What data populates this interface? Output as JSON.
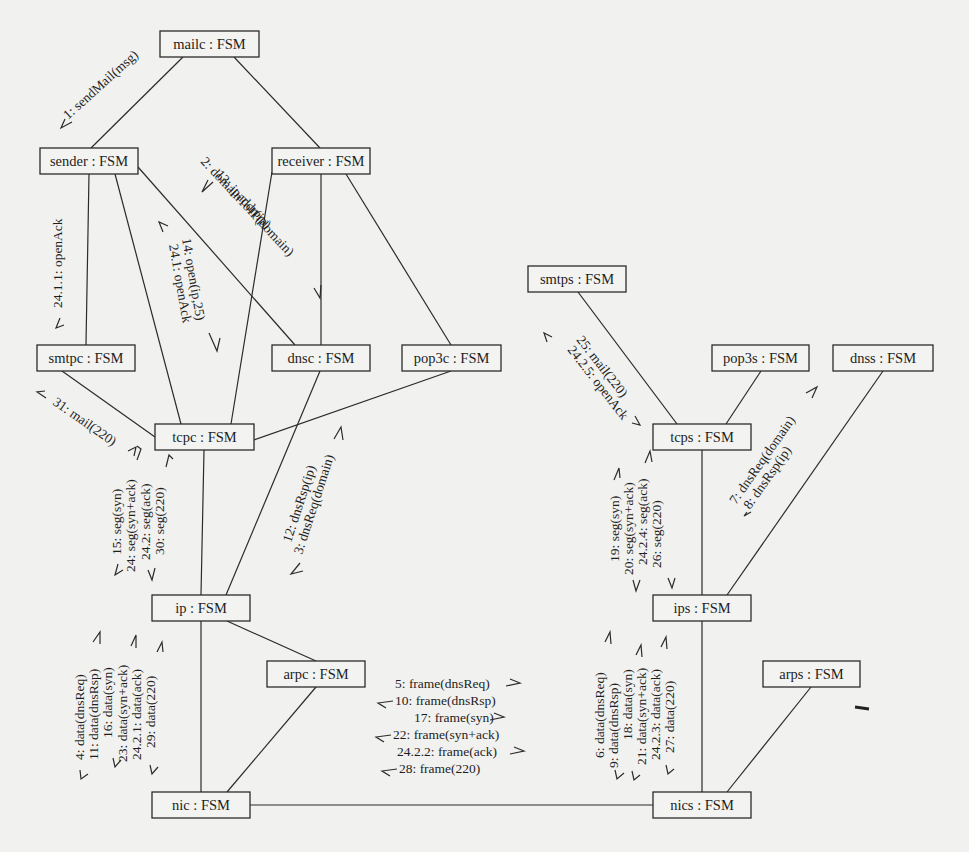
{
  "diagram": {
    "type": "UML communication diagram",
    "objects": [
      {
        "id": "mailc",
        "label": "mailc : FSM",
        "x": 160,
        "y": 31,
        "w": 99,
        "h": 26
      },
      {
        "id": "sender",
        "label": "sender : FSM",
        "x": 40,
        "y": 148,
        "w": 98,
        "h": 26
      },
      {
        "id": "receiver",
        "label": "receiver : FSM",
        "x": 272,
        "y": 148,
        "w": 98,
        "h": 26
      },
      {
        "id": "smtpc",
        "label": "smtpc : FSM",
        "x": 37,
        "y": 345,
        "w": 98,
        "h": 26
      },
      {
        "id": "dnsc",
        "label": "dnsc : FSM",
        "x": 272,
        "y": 345,
        "w": 98,
        "h": 26
      },
      {
        "id": "pop3c",
        "label": "pop3c : FSM",
        "x": 402,
        "y": 345,
        "w": 99,
        "h": 26
      },
      {
        "id": "tcpc",
        "label": "tcpc : FSM",
        "x": 155,
        "y": 424,
        "w": 99,
        "h": 26
      },
      {
        "id": "smtps",
        "label": "smtps : FSM",
        "x": 528,
        "y": 266,
        "w": 98,
        "h": 26
      },
      {
        "id": "pop3s",
        "label": "pop3s : FSM",
        "x": 712,
        "y": 345,
        "w": 97,
        "h": 26
      },
      {
        "id": "dnss",
        "label": "dnss : FSM",
        "x": 833,
        "y": 345,
        "w": 100,
        "h": 26
      },
      {
        "id": "tcps",
        "label": "tcps : FSM",
        "x": 653,
        "y": 424,
        "w": 98,
        "h": 26
      },
      {
        "id": "ip",
        "label": "ip : FSM",
        "x": 152,
        "y": 595,
        "w": 98,
        "h": 26
      },
      {
        "id": "arpc",
        "label": "arpc : FSM",
        "x": 267,
        "y": 661,
        "w": 98,
        "h": 26
      },
      {
        "id": "ips",
        "label": "ips : FSM",
        "x": 653,
        "y": 595,
        "w": 98,
        "h": 26
      },
      {
        "id": "arps",
        "label": "arps : FSM",
        "x": 763,
        "y": 661,
        "w": 97,
        "h": 26
      },
      {
        "id": "nic",
        "label": "nic : FSM",
        "x": 152,
        "y": 792,
        "w": 98,
        "h": 26
      },
      {
        "id": "nics",
        "label": "nics : FSM",
        "x": 653,
        "y": 792,
        "w": 98,
        "h": 26
      }
    ],
    "links": [
      {
        "from": "mailc",
        "to": "sender",
        "x1": 183,
        "y1": 57,
        "x2": 91,
        "y2": 148
      },
      {
        "from": "mailc",
        "to": "receiver",
        "x1": 234,
        "y1": 57,
        "x2": 320,
        "y2": 148
      },
      {
        "from": "sender",
        "to": "smtpc",
        "x1": 89,
        "y1": 174,
        "x2": 86,
        "y2": 345
      },
      {
        "from": "sender",
        "to": "tcpc",
        "x1": 115,
        "y1": 174,
        "x2": 181,
        "y2": 424
      },
      {
        "from": "sender",
        "to": "dnsc",
        "x1": 138,
        "y1": 167,
        "x2": 295,
        "y2": 345
      },
      {
        "from": "receiver",
        "to": "tcpc",
        "x1": 272,
        "y1": 172,
        "x2": 231,
        "y2": 424
      },
      {
        "from": "receiver",
        "to": "dnsc",
        "x1": 321,
        "y1": 174,
        "x2": 321,
        "y2": 345
      },
      {
        "from": "receiver",
        "to": "pop3c",
        "x1": 346,
        "y1": 174,
        "x2": 451,
        "y2": 345
      },
      {
        "from": "smtpc",
        "to": "tcpc",
        "x1": 62,
        "y1": 371,
        "x2": 155,
        "y2": 437
      },
      {
        "from": "pop3c",
        "to": "tcpc",
        "x1": 451,
        "y1": 371,
        "x2": 254,
        "y2": 440
      },
      {
        "from": "dnsc",
        "to": "ip",
        "x1": 320,
        "y1": 371,
        "x2": 226,
        "y2": 595
      },
      {
        "from": "tcpc",
        "to": "ip",
        "x1": 204,
        "y1": 450,
        "x2": 201,
        "y2": 595
      },
      {
        "from": "smtps",
        "to": "tcps",
        "x1": 578,
        "y1": 292,
        "x2": 677,
        "y2": 424
      },
      {
        "from": "pop3s",
        "to": "tcps",
        "x1": 761,
        "y1": 371,
        "x2": 726,
        "y2": 424
      },
      {
        "from": "dnss",
        "to": "ips",
        "x1": 883,
        "y1": 371,
        "x2": 727,
        "y2": 595
      },
      {
        "from": "tcps",
        "to": "ips",
        "x1": 702,
        "y1": 450,
        "x2": 702,
        "y2": 595
      },
      {
        "from": "ip",
        "to": "arpc",
        "x1": 227,
        "y1": 621,
        "x2": 316,
        "y2": 661
      },
      {
        "from": "ip",
        "to": "nic",
        "x1": 201,
        "y1": 621,
        "x2": 201,
        "y2": 792
      },
      {
        "from": "arpc",
        "to": "nic",
        "x1": 316,
        "y1": 687,
        "x2": 227,
        "y2": 792
      },
      {
        "from": "ips",
        "to": "nics",
        "x1": 702,
        "y1": 621,
        "x2": 702,
        "y2": 792
      },
      {
        "from": "arps",
        "to": "nics",
        "x1": 811,
        "y1": 687,
        "x2": 727,
        "y2": 792
      },
      {
        "from": "nic",
        "to": "nics",
        "x1": 250,
        "y1": 805,
        "x2": 653,
        "y2": 805
      }
    ],
    "message_groups": [
      {
        "id": "mailc-sender",
        "messages": [
          "1: sendMail(msg)"
        ]
      },
      {
        "id": "receiver-dnsc",
        "messages": [
          "2: domainToIP(domain)",
          "13: ipaddr(ip)"
        ]
      },
      {
        "id": "sender-smtpc",
        "messages": [
          "24.1.1: openAck"
        ]
      },
      {
        "id": "sender-tcpc",
        "messages": [
          "14: open(ip,25)",
          "24.1: openAck"
        ]
      },
      {
        "id": "smtpc-tcpc",
        "messages": [
          "31: mail(220)"
        ]
      },
      {
        "id": "tcpc-ip",
        "messages": [
          "15: seg(syn)",
          "24: seg(syn+ack)",
          "24.2: seg(ack)",
          "30: seg(220)"
        ]
      },
      {
        "id": "dnsc-ip",
        "messages": [
          "12: dnsRsp(ip)",
          "3: dnsReq(domain)"
        ]
      },
      {
        "id": "ip-nic",
        "messages": [
          "4: data(dnsReq)",
          "11: data(dnsRsp)",
          "16: data(syn)",
          "23: data(syn+ack)",
          "24.2.1: data(ack)",
          "29: data(220)"
        ]
      },
      {
        "id": "nic-nics",
        "messages": [
          "5: frame(dnsReq)",
          "10: frame(dnsRsp)",
          "17: frame(syn)",
          "22: frame(syn+ack)",
          "24.2.2: frame(ack)",
          "28: frame(220)"
        ]
      },
      {
        "id": "smtps-tcps",
        "messages": [
          "25: mail(220)",
          "24.2.5: openAck"
        ]
      },
      {
        "id": "tcps-dnss",
        "messages": [
          "7: dnsReq(domain)",
          "8: dnsRsp(ip)"
        ]
      },
      {
        "id": "tcps-ips",
        "messages": [
          "19: seg(syn)",
          "20: seg(syn+ack)",
          "24.2.4: seg(ack)",
          "26: seg(220)"
        ]
      },
      {
        "id": "ips-nics",
        "messages": [
          "6: data(dnsReq)",
          "9: data(dnsRsp)",
          "18: data(syn)",
          "21: data(syn+ack)",
          "24.2.3: data(ack)",
          "27: data(220)"
        ]
      }
    ]
  },
  "colors": {
    "paper": "#f1f1ef",
    "ink": "#2b2b2b",
    "bleed_through": "#cfcfcc"
  }
}
